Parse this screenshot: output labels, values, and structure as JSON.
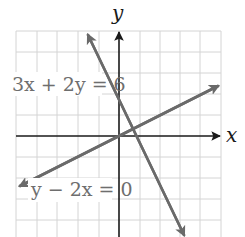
{
  "graph": {
    "axes": {
      "x_label": "x",
      "y_label": "y"
    },
    "grid": {
      "columns": 10,
      "rows": 10,
      "unit_px": 20.5
    },
    "equations": [
      {
        "id": "line-1",
        "label": "3x + 2y = 6",
        "slope": -1.5,
        "y_intercept": 3,
        "color": "#6a6a6a"
      },
      {
        "id": "line-2",
        "label": "y − 2x = 0",
        "slope": 0.5,
        "y_intercept": 0,
        "color": "#6a6a6a"
      }
    ],
    "colors": {
      "grid": "#d4d4d4",
      "axis": "#1a1a1a",
      "line": "#6a6a6a"
    }
  }
}
